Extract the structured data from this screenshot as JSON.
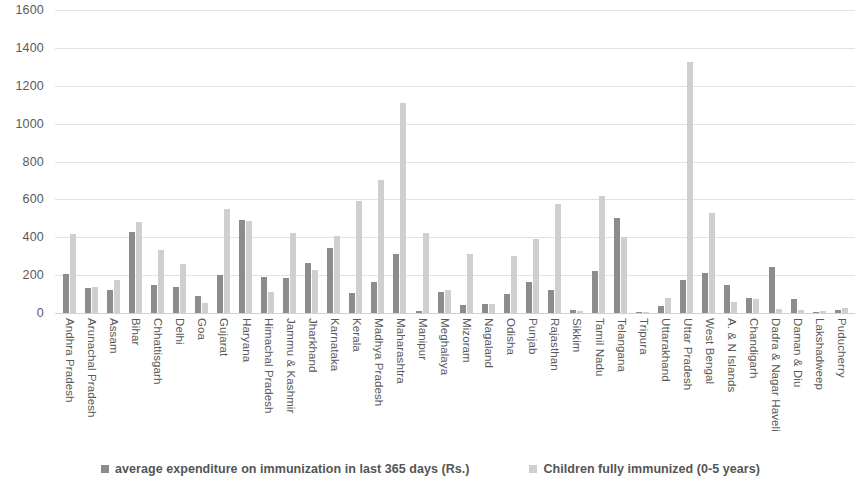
{
  "chart_data": {
    "type": "bar",
    "title": "",
    "xlabel": "",
    "ylabel": "",
    "ylim": [
      0,
      1600
    ],
    "ytick_step": 200,
    "yticks": [
      1600,
      1400,
      1200,
      1000,
      800,
      600,
      400,
      200,
      0
    ],
    "grid": true,
    "legend_position": "bottom",
    "categories": [
      "Andhra Pradesh",
      "Arunachal Pradesh",
      "Assam",
      "Bihar",
      "Chhattisgarh",
      "Delhi",
      "Goa",
      "Gujarat",
      "Haryana",
      "Himachal Pradesh",
      "Jammu & Kashmir",
      "Jharkhand",
      "Karnataka",
      "Kerala",
      "Madhya Pradesh",
      "Maharashtra",
      "Manipur",
      "Meghalaya",
      "Mizoram",
      "Nagaland",
      "Odisha",
      "Punjab",
      "Rajasthan",
      "Sikkim",
      "Tamil Nadu",
      "Telangana",
      "Tripura",
      "Uttarakhand",
      "Uttar Pradesh",
      "West Bengal",
      "A. & N Islands",
      "Chandigarh",
      "Dadra & Nagar Haveli",
      "Daman & Diu",
      "Lakshadweep",
      "Puducherry"
    ],
    "series": [
      {
        "name": "average expenditure on immunization in last 365 days (Rs.)",
        "color": "#8c8c8c",
        "values": [
          205,
          130,
          120,
          430,
          150,
          135,
          90,
          200,
          490,
          190,
          185,
          265,
          345,
          105,
          165,
          310,
          10,
          110,
          40,
          50,
          100,
          165,
          120,
          15,
          220,
          500,
          5,
          35,
          175,
          210,
          150,
          80,
          245,
          75,
          5,
          15
        ]
      },
      {
        "name": "Children fully immunized (0-5 years)",
        "color": "#cfcfcf",
        "values": [
          415,
          135,
          175,
          480,
          335,
          260,
          55,
          550,
          485,
          110,
          420,
          225,
          405,
          590,
          700,
          1110,
          425,
          120,
          310,
          45,
          300,
          390,
          575,
          10,
          620,
          400,
          5,
          80,
          1325,
          530,
          60,
          75,
          20,
          15,
          10,
          25
        ]
      }
    ]
  },
  "legend": {
    "items": [
      {
        "label": "average expenditure on immunization in last 365 days (Rs.)",
        "color": "#8c8c8c"
      },
      {
        "label": "Children fully immunized (0-5 years)",
        "color": "#cfcfcf"
      }
    ]
  }
}
